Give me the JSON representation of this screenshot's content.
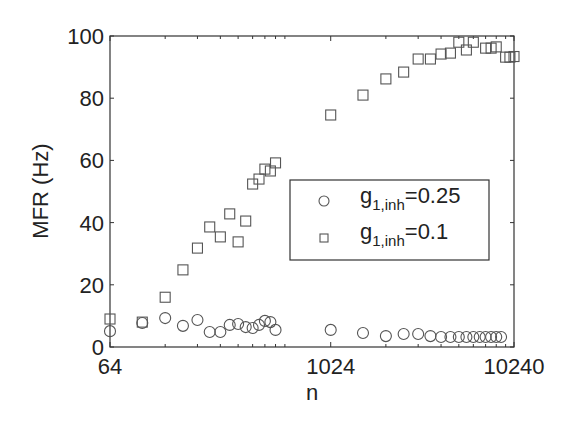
{
  "chart_data": {
    "type": "scatter",
    "title": "",
    "xlabel": "n",
    "ylabel": "MFR (Hz)",
    "xscale": "log",
    "xlim": [
      64,
      10240
    ],
    "ylim": [
      0,
      100
    ],
    "x_ticks": [
      64,
      1024,
      10240
    ],
    "x_tick_labels": [
      "64",
      "1024",
      "10240"
    ],
    "y_ticks": [
      0,
      20,
      40,
      60,
      80,
      100
    ],
    "y_tick_labels": [
      "0",
      "20",
      "40",
      "60",
      "80",
      "100"
    ],
    "grid": false,
    "legend_position": "center-right",
    "series": [
      {
        "name": "g_{1,inh}=0.25",
        "legend_main": "g",
        "legend_sub": "1,inh",
        "legend_rest": "=0.25",
        "marker": "circle",
        "x": [
          64,
          96,
          128,
          160,
          192,
          224,
          256,
          288,
          320,
          352,
          384,
          416,
          448,
          480,
          512,
          1024,
          1536,
          2048,
          2560,
          3072,
          3584,
          4096,
          4608,
          5120,
          5632,
          6144,
          6656,
          7168,
          7680,
          8192,
          8704
        ],
        "y": [
          5.1,
          7.7,
          9.3,
          6.8,
          8.7,
          4.8,
          4.8,
          7.1,
          7.4,
          6.4,
          6.1,
          7.1,
          8.4,
          8.0,
          5.5,
          5.5,
          4.5,
          3.5,
          4.2,
          4.2,
          3.5,
          3.2,
          3.2,
          3.2,
          3.2,
          3.2,
          3.2,
          3.2,
          3.2,
          3.2,
          3.2
        ]
      },
      {
        "name": "g_{1,inh}=0.1",
        "legend_main": "g",
        "legend_sub": "1,inh",
        "legend_rest": "=0.1",
        "marker": "square",
        "x": [
          64,
          96,
          128,
          160,
          192,
          224,
          256,
          288,
          320,
          352,
          384,
          416,
          448,
          480,
          512,
          1024,
          1536,
          2048,
          2560,
          3072,
          3584,
          4096,
          4608,
          5120,
          5632,
          6144,
          7168,
          7680,
          8192,
          9216,
          9728,
          10240
        ],
        "y": [
          9.0,
          8.0,
          16.0,
          24.8,
          31.8,
          38.6,
          35.4,
          42.8,
          33.8,
          40.5,
          52.4,
          54.0,
          57.2,
          56.6,
          59.2,
          74.6,
          81.0,
          86.2,
          88.4,
          92.6,
          92.6,
          94.2,
          94.5,
          98.0,
          95.5,
          98.0,
          96.1,
          96.1,
          96.5,
          93.2,
          93.2,
          93.4
        ]
      }
    ]
  }
}
